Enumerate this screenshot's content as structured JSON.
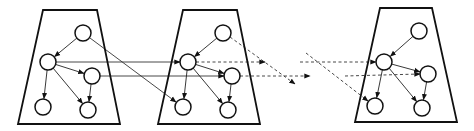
{
  "diagram": {
    "title": "",
    "colors": {
      "stroke": "#111111",
      "background": "#ffffff"
    },
    "node_radius": 8,
    "panels": [
      {
        "id": "panel-1",
        "trapezoid": [
          [
            43,
            10
          ],
          [
            97,
            10
          ],
          [
            120,
            124
          ],
          [
            18,
            124
          ]
        ],
        "nodes": [
          {
            "id": "a",
            "x": 83,
            "y": 33
          },
          {
            "id": "b",
            "x": 48,
            "y": 62
          },
          {
            "id": "c",
            "x": 92,
            "y": 76
          },
          {
            "id": "d",
            "x": 43,
            "y": 107
          },
          {
            "id": "e",
            "x": 88,
            "y": 110
          }
        ]
      },
      {
        "id": "panel-2",
        "trapezoid": [
          [
            183,
            10
          ],
          [
            237,
            10
          ],
          [
            260,
            124
          ],
          [
            158,
            124
          ]
        ],
        "nodes": [
          {
            "id": "a",
            "x": 223,
            "y": 33
          },
          {
            "id": "b",
            "x": 188,
            "y": 62
          },
          {
            "id": "c",
            "x": 232,
            "y": 76
          },
          {
            "id": "d",
            "x": 183,
            "y": 107
          },
          {
            "id": "e",
            "x": 228,
            "y": 110
          }
        ]
      },
      {
        "id": "panel-3",
        "trapezoid": [
          [
            380,
            8
          ],
          [
            432,
            8
          ],
          [
            457,
            122
          ],
          [
            355,
            122
          ]
        ],
        "nodes": [
          {
            "id": "a",
            "x": 419,
            "y": 31
          },
          {
            "id": "b",
            "x": 384,
            "y": 62
          },
          {
            "id": "c",
            "x": 428,
            "y": 74
          },
          {
            "id": "d",
            "x": 375,
            "y": 106
          },
          {
            "id": "e",
            "x": 422,
            "y": 108
          }
        ]
      }
    ],
    "internal_edges": [
      [
        "a",
        "b"
      ],
      [
        "b",
        "c"
      ],
      [
        "b",
        "d"
      ],
      [
        "b",
        "e"
      ],
      [
        "c",
        "e"
      ]
    ],
    "cross_links": [
      {
        "style": "solid",
        "from": [
          56,
          62
        ],
        "to": [
          180,
          62
        ],
        "arrow": true
      },
      {
        "style": "solid",
        "from": [
          100,
          76
        ],
        "to": [
          224,
          76
        ],
        "arrow": true
      },
      {
        "style": "solid",
        "from": [
          90,
          38
        ],
        "to": [
          176,
          102
        ],
        "arrow": true
      },
      {
        "style": "dashed",
        "from": [
          196,
          62
        ],
        "to": [
          265,
          62
        ],
        "arrow": true
      },
      {
        "style": "dashed",
        "from": [
          240,
          76
        ],
        "to": [
          310,
          76
        ],
        "arrow": true
      },
      {
        "style": "dashed",
        "from": [
          230,
          37
        ],
        "to": [
          295,
          84
        ],
        "arrow": true
      },
      {
        "style": "dashed",
        "from": [
          300,
          62
        ],
        "to": [
          376,
          62
        ],
        "arrow": true
      },
      {
        "style": "dashed",
        "from": [
          345,
          76
        ],
        "to": [
          420,
          74
        ],
        "arrow": true
      },
      {
        "style": "dashed",
        "from": [
          306,
          53
        ],
        "to": [
          368,
          101
        ],
        "arrow": true
      }
    ]
  }
}
